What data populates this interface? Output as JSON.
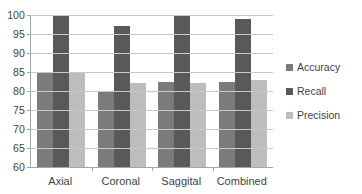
{
  "chart_data": {
    "type": "bar",
    "title": "",
    "xlabel": "",
    "ylabel": "",
    "ylim": [
      60,
      100
    ],
    "ytick_step": 5,
    "yticks": [
      100,
      95,
      90,
      85,
      80,
      75,
      70,
      65,
      60
    ],
    "grid": true,
    "legend_position": "right",
    "categories": [
      "Axial",
      "Coronal",
      "Saggital",
      "Combined"
    ],
    "series": [
      {
        "name": "Accuracy",
        "color": "#7b7b7b",
        "values": [
          85,
          80,
          82.5,
          82.5
        ]
      },
      {
        "name": "Recall",
        "color": "#595959",
        "values": [
          100,
          97,
          100,
          99
        ]
      },
      {
        "name": "Precision",
        "color": "#bdbdbd",
        "values": [
          84.8,
          82,
          82,
          83
        ]
      }
    ]
  }
}
